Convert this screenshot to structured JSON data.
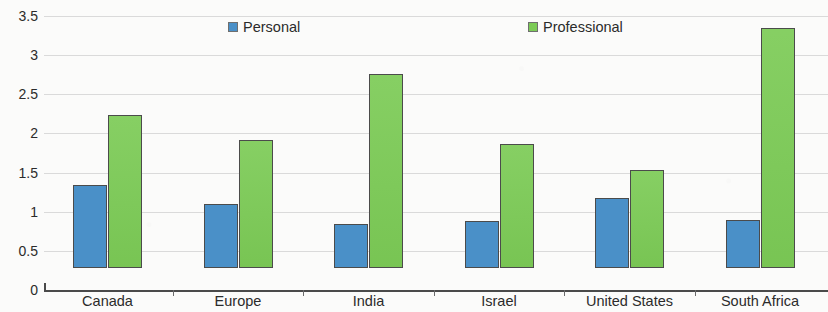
{
  "chart_data": {
    "type": "bar",
    "title": "",
    "subtitle": "",
    "xlabel": "",
    "ylabel": "",
    "categories": [
      "Canada",
      "Europe",
      "India",
      "Israel",
      "United States",
      "South Africa"
    ],
    "series": [
      {
        "name": "Personal",
        "color": "#4a90c8",
        "values": [
          1.06,
          0.82,
          0.56,
          0.6,
          0.9,
          0.61
        ]
      },
      {
        "name": "Professional",
        "color": "#7ccb56",
        "values": [
          1.96,
          1.64,
          2.48,
          1.58,
          1.25,
          3.07
        ]
      }
    ],
    "ylim": [
      0,
      3.5
    ],
    "yticks": [
      0,
      0.5,
      1,
      1.5,
      2,
      2.5,
      3,
      3.5
    ],
    "ytick_labels": [
      "0",
      "0.5",
      "1",
      "1.5",
      "2",
      "2.5",
      "3",
      "3.5"
    ],
    "grid": true,
    "grid_color": "#cfcfcf",
    "legend": [
      "Personal",
      "Professional"
    ],
    "legend_position": "top-center",
    "axis_color": "#4a4a4a",
    "background_color": "#fbfbfa"
  }
}
